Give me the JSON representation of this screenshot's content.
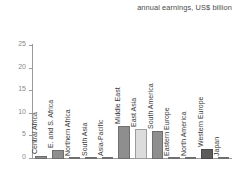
{
  "subtitle": "annual earnings, US$ billion",
  "colors": {
    "bar_default": "#8e8e8e",
    "bar_highlight": "#dcdcdc",
    "bar_dark": "#5c5c5c",
    "axis": "#9a9a9a",
    "tick_text": "#8a8a8a",
    "label_text": "#3a3a3a",
    "background": "#ffffff"
  },
  "chart_data": {
    "type": "bar",
    "title": "",
    "subtitle": "annual earnings, US$ billion",
    "xlabel": "",
    "ylabel": "",
    "ylim": [
      0,
      25
    ],
    "yticks": [
      0,
      5,
      10,
      15,
      20,
      25
    ],
    "ytick_labels": [
      "0",
      "5",
      "10",
      "15",
      "20",
      "25"
    ],
    "grid": false,
    "legend": "none",
    "categories": [
      "Central Africa",
      "E. and S. Africa",
      "Northern Africa",
      "South Asia",
      "Asia-Pacific",
      "Middle East",
      "East Asia",
      "South America",
      "Eastern Europe",
      "North America",
      "Western Europe",
      "Japan"
    ],
    "values": [
      0.7,
      2.1,
      0.05,
      0.2,
      0.15,
      7.3,
      6.6,
      6.2,
      0.05,
      0.05,
      2.3,
      0.05
    ],
    "bar_styles": [
      "default",
      "default",
      "default",
      "default",
      "default",
      "default",
      "highlight",
      "default",
      "default",
      "default",
      "dark",
      "default"
    ]
  }
}
